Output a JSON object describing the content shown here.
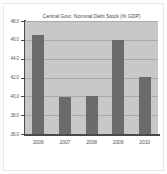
{
  "chart_data": {
    "type": "bar",
    "title": "Central Govt. Nominal Debt Stock (% GDP)",
    "xlabel": "",
    "ylabel": "",
    "categories": [
      "2006",
      "2007",
      "2008",
      "2009",
      "2010"
    ],
    "values": [
      46.5,
      39.9,
      40.0,
      46.0,
      42.1
    ],
    "ylim": [
      36.0,
      48.0
    ],
    "ytick_labels": [
      "48.0",
      "46.0",
      "44.0",
      "42.0",
      "40.0",
      "38.0",
      "36.0"
    ],
    "ytick_values": [
      48.0,
      46.0,
      44.0,
      42.0,
      40.0,
      38.0,
      36.0
    ],
    "grid": "horizontal",
    "legend": "none",
    "colors": {
      "bar": "#6b6b6b",
      "plot_background": "#c8c8c8",
      "figure_background": "#ffffff",
      "gridline": "#a9a9a9",
      "axis": "#4a4a4a",
      "text": "#555555"
    }
  }
}
